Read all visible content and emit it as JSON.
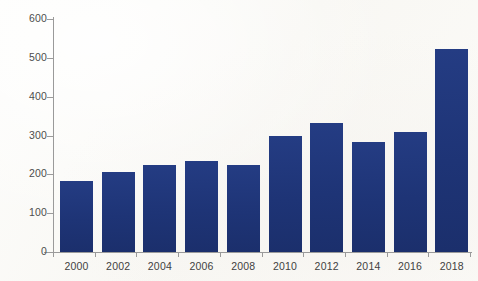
{
  "chart_data": {
    "type": "bar",
    "title": "",
    "subtitle": "",
    "xlabel": "",
    "ylabel": "",
    "categories": [
      "2000",
      "2002",
      "2004",
      "2006",
      "2008",
      "2010",
      "2012",
      "2014",
      "2016",
      "2018"
    ],
    "values": [
      184,
      205,
      225,
      235,
      225,
      298,
      332,
      283,
      310,
      522
    ],
    "series": [
      {
        "name": "",
        "values": [
          184,
          205,
          225,
          235,
          225,
          298,
          332,
          283,
          310,
          522
        ]
      }
    ],
    "ylim": [
      0,
      600
    ],
    "y_ticks": [
      0,
      100,
      200,
      300,
      400,
      500,
      600
    ],
    "y_tick_labels": [
      "0",
      "100",
      "200",
      "300",
      "400",
      "500",
      "600"
    ],
    "x_tick_labels": [
      "2000",
      "2002",
      "2004",
      "2006",
      "2008",
      "2010",
      "2012",
      "2014",
      "2016",
      "2018"
    ],
    "grid": false,
    "legend": false,
    "legend_position": "none",
    "bar_color": "#1f3579",
    "axis_color": "#9a9a9a",
    "background_color": "#fbfaf8",
    "annotations": []
  }
}
